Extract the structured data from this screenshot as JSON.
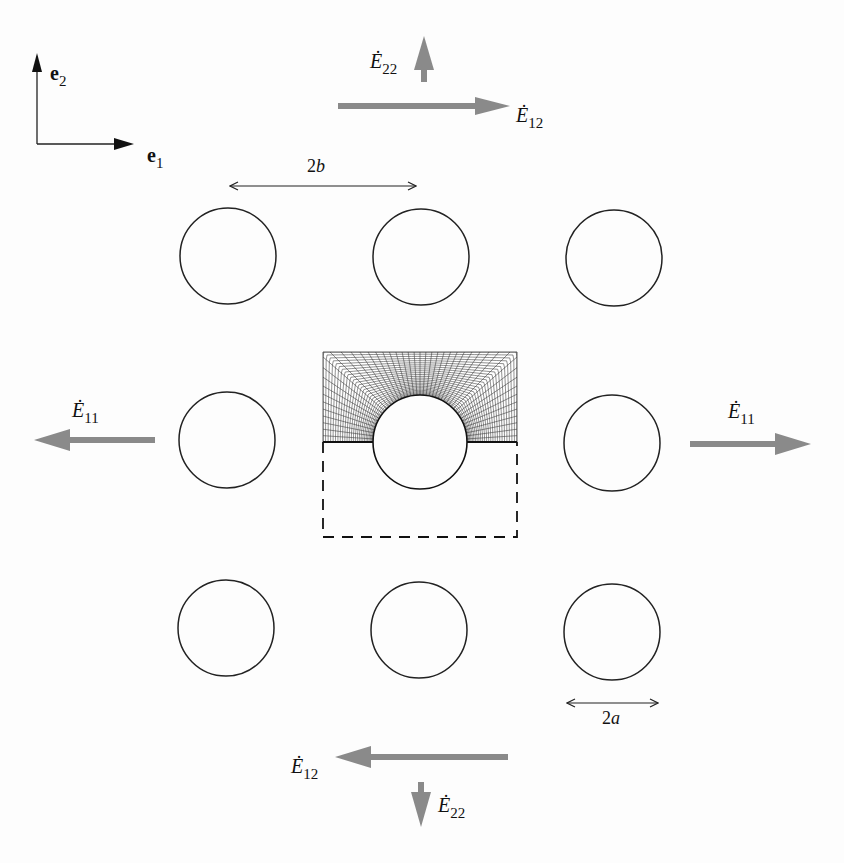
{
  "figure": {
    "type": "schematic",
    "basis": {
      "e1_label": "e",
      "e1_sub": "1",
      "e2_label": "e",
      "e2_sub": "2"
    },
    "dimensions": {
      "spacing_label": "2b",
      "spacing_base": "2",
      "spacing_var": "b",
      "diameter_label": "2a",
      "diameter_base": "2",
      "diameter_var": "a"
    },
    "loads": {
      "E11_left": {
        "symbol": "Ė",
        "sub": "11",
        "direction": "left"
      },
      "E11_right": {
        "symbol": "Ė",
        "sub": "11",
        "direction": "right"
      },
      "E22_top": {
        "symbol": "Ė",
        "sub": "22",
        "direction": "up"
      },
      "E22_bottom": {
        "symbol": "Ė",
        "sub": "22",
        "direction": "down"
      },
      "E12_top": {
        "symbol": "Ė",
        "sub": "12",
        "direction": "right"
      },
      "E12_bottom": {
        "symbol": "Ė",
        "sub": "12",
        "direction": "left"
      }
    },
    "grid": {
      "rows": 3,
      "cols": 3
    },
    "unit_cell": {
      "meshed_half": "upper",
      "dashed_half": "lower"
    },
    "colors": {
      "arrow_gray": "#8a8a8a",
      "line": "#222222",
      "mesh": "#333333",
      "background": "#fdfdfd"
    }
  }
}
